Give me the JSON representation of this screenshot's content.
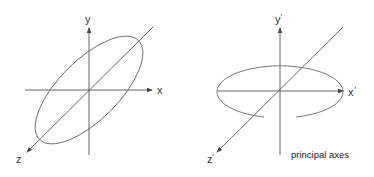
{
  "diagram": {
    "left_panel": {
      "labels": {
        "x": "x",
        "y": "y",
        "z": "z"
      }
    },
    "right_panel": {
      "labels": {
        "x": "x",
        "y": "y",
        "z": "z",
        "prime": "′"
      },
      "caption": "principal axes"
    },
    "colors": {
      "axis": "#555555",
      "ellipse": "#666666",
      "text": "#333333"
    }
  }
}
